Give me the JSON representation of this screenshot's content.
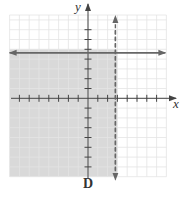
{
  "figure": {
    "caption": "D",
    "x_axis_label": "x",
    "y_axis_label": "y"
  },
  "colors": {
    "shade": "#d9d9d9",
    "grid": "#e4e4e4",
    "axis": "#444444",
    "boundary": "#666666",
    "background": "#ffffff"
  },
  "chart_data": {
    "type": "inequality-graph",
    "title": "D",
    "xlabel": "x",
    "ylabel": "y",
    "xlim": [
      -8,
      8
    ],
    "ylim": [
      -8,
      8
    ],
    "grid": true,
    "tick_step": 1,
    "x_ticks": [
      -7,
      -6,
      -5,
      -4,
      -3,
      -2,
      -1,
      1,
      2,
      3,
      4,
      5,
      6,
      7
    ],
    "y_ticks": [
      -7,
      -6,
      -5,
      -4,
      -3,
      -2,
      -1,
      1,
      2,
      3,
      4,
      5,
      6,
      7
    ],
    "boundaries": [
      {
        "equation": "y = 5",
        "style": "solid",
        "orientation": "horizontal",
        "value": 5
      },
      {
        "equation": "x = 3",
        "style": "dashed",
        "orientation": "vertical",
        "value": 3
      }
    ],
    "shaded_region": {
      "description": "x < 3 and y <= 5",
      "x_range": [
        -8,
        3
      ],
      "y_range": [
        -8,
        5
      ]
    },
    "inequalities": [
      "x < 3",
      "y <= 5"
    ]
  }
}
